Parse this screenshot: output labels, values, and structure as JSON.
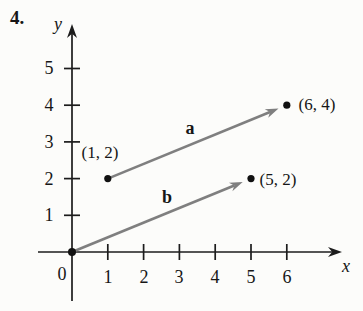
{
  "problem_number": "4.",
  "figure": {
    "type": "vector-diagram",
    "x_axis_label": "x",
    "y_axis_label": "y",
    "origin": {
      "label": "0",
      "x": 0,
      "y": 0
    },
    "x_tick_labels": [
      "1",
      "2",
      "3",
      "4",
      "5",
      "6"
    ],
    "y_tick_labels": [
      "1",
      "2",
      "3",
      "4",
      "5"
    ],
    "points": [
      {
        "label": "(1, 2)",
        "x": 1,
        "y": 2
      },
      {
        "label": "(6, 4)",
        "x": 6,
        "y": 4
      },
      {
        "label": "(5, 2)",
        "x": 5,
        "y": 2
      }
    ],
    "vectors": [
      {
        "name": "a",
        "label": "a",
        "from": [
          1,
          2
        ],
        "to": [
          6,
          4
        ]
      },
      {
        "name": "b",
        "label": "b",
        "from": [
          0,
          0
        ],
        "to": [
          5,
          2
        ]
      }
    ],
    "colors": {
      "vector": "#7f7f7f",
      "axis": "#1c1c1c",
      "point": "#111111",
      "background": "#fcfcfa"
    }
  }
}
